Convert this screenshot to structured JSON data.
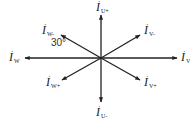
{
  "diagram": {
    "type": "phasor-diagram",
    "center": [
      101,
      58
    ],
    "line_color": "#222222",
    "angle_label": "30°",
    "vectors": [
      {
        "id": "u_plus",
        "base": "I",
        "sub": "U+",
        "to": [
          101,
          15
        ],
        "label_pos": [
          96,
          1
        ]
      },
      {
        "id": "u_minus",
        "base": "I",
        "sub": "U-",
        "to": [
          101,
          102
        ],
        "label_pos": [
          96,
          106
        ]
      },
      {
        "id": "v",
        "base": "I",
        "sub": "V",
        "to": [
          177,
          58
        ],
        "label_pos": [
          181,
          51
        ]
      },
      {
        "id": "w",
        "base": "I",
        "sub": "W",
        "to": [
          25,
          58
        ],
        "label_pos": [
          9,
          51
        ]
      },
      {
        "id": "v_minus",
        "base": "I",
        "sub": "V-",
        "to": [
          140,
          35
        ],
        "label_pos": [
          144,
          24
        ]
      },
      {
        "id": "v_plus",
        "base": "I",
        "sub": "V+",
        "to": [
          140,
          80
        ],
        "label_pos": [
          144,
          76
        ]
      },
      {
        "id": "w_minus",
        "base": "I",
        "sub": "W-",
        "to": [
          61,
          35
        ],
        "label_pos": [
          42,
          24
        ]
      },
      {
        "id": "w_plus",
        "base": "I",
        "sub": "W+",
        "to": [
          62,
          80
        ],
        "label_pos": [
          46,
          76
        ]
      }
    ]
  }
}
